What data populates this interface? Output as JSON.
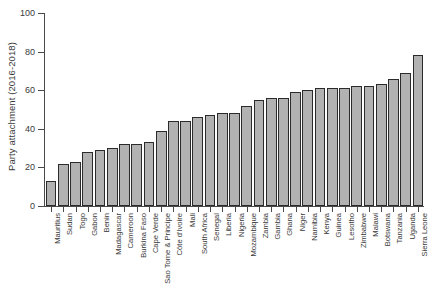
{
  "chart": {
    "type": "bar",
    "title": "",
    "ylabel": "Party attachment (2016-2018)",
    "xlabel": ""
  },
  "chart_data": {
    "type": "bar",
    "title": "",
    "xlabel": "",
    "ylabel": "Party attachment (2016-2018)",
    "ylim": [
      0,
      100
    ],
    "yticks": [
      0,
      20,
      40,
      60,
      80,
      100
    ],
    "grid": false,
    "legend": null,
    "bar_color": "#b2b2b2",
    "bar_edge_color": "#2b2b2b",
    "categories": [
      "Mauritius",
      "Sudan",
      "Togo",
      "Gabon",
      "Benin",
      "Madagascar",
      "Cameroon",
      "Burkina Faso",
      "Cape Verde",
      "Sao Tome & Principe",
      "Côte d'Ivoire",
      "Mali",
      "South Africa",
      "Senegal",
      "Liberia",
      "Nigeria",
      "Mozambique",
      "Zambia",
      "Gambia",
      "Ghana",
      "Niger",
      "Namibia",
      "Kenya",
      "Guinea",
      "Lesotho",
      "Zimbabwe",
      "Malawi",
      "Botswana",
      "Tanzania",
      "Uganda",
      "Sierra Leone"
    ],
    "values": [
      13,
      22,
      23,
      28,
      29,
      30,
      32,
      32,
      33,
      39,
      44,
      44,
      46,
      47,
      48,
      48,
      52,
      55,
      56,
      56,
      59,
      60,
      61,
      61,
      61,
      62,
      62,
      63,
      66,
      69,
      78
    ]
  }
}
